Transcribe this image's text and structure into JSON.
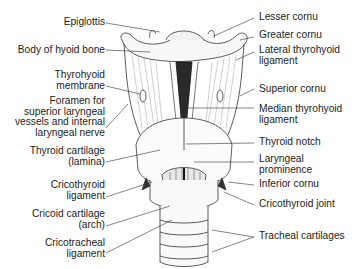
{
  "figure": {
    "type": "anatomical illustration",
    "top_cut_text": "..p..."
  },
  "labels_left": [
    {
      "id": "epiglottis",
      "lines": [
        "Epiglottis"
      ]
    },
    {
      "id": "body-of-hyoid-bone",
      "lines": [
        "Body of hyoid bone"
      ]
    },
    {
      "id": "thyrohyoid-membrane",
      "lines": [
        "Thyrohyoid",
        "membrane"
      ]
    },
    {
      "id": "foramen",
      "lines": [
        "Foramen for",
        "superior laryngeal",
        "vessels and internal",
        "laryngeal nerve"
      ]
    },
    {
      "id": "thyroid-cartilage-lamina",
      "lines": [
        "Thyroid cartilage",
        "(lamina)"
      ]
    },
    {
      "id": "cricothyroid-ligament",
      "lines": [
        "Cricothyroid",
        "ligament"
      ]
    },
    {
      "id": "cricoid-cartilage-arch",
      "lines": [
        "Cricoid cartilage",
        "(arch)"
      ]
    },
    {
      "id": "cricotracheal-ligament",
      "lines": [
        "Cricotracheal",
        "ligament"
      ]
    }
  ],
  "labels_right": [
    {
      "id": "lesser-cornu",
      "lines": [
        "Lesser cornu"
      ]
    },
    {
      "id": "greater-cornu",
      "lines": [
        "Greater cornu"
      ]
    },
    {
      "id": "lateral-thyrohyoid-ligament",
      "lines": [
        "Lateral thyrohyoid",
        "ligament"
      ]
    },
    {
      "id": "superior-cornu",
      "lines": [
        "Superior cornu"
      ]
    },
    {
      "id": "median-thyrohyoid-ligament",
      "lines": [
        "Median thyrohyoid",
        "ligament"
      ]
    },
    {
      "id": "thyroid-notch",
      "lines": [
        "Thyroid notch"
      ]
    },
    {
      "id": "laryngeal-prominence",
      "lines": [
        "Laryngeal",
        "prominence"
      ]
    },
    {
      "id": "inferior-cornu",
      "lines": [
        "Inferior cornu"
      ]
    },
    {
      "id": "cricothyroid-joint",
      "lines": [
        "Cricothyroid joint"
      ]
    },
    {
      "id": "tracheal-cartilages",
      "lines": [
        "Tracheal cartilages"
      ]
    }
  ],
  "colors": {
    "ink": "#1c1c1c",
    "background": "#ffffff",
    "line": "#333333"
  }
}
